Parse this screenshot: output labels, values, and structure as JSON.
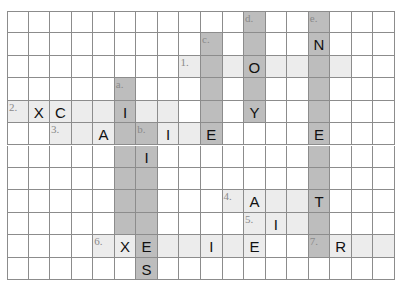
{
  "puzzle": {
    "rows": 12,
    "cols": 18,
    "colors": {
      "grid_line": "#8c8c8c",
      "across_fill": "#ececec",
      "down_fill": "#bdbdbd",
      "letter": "#111111",
      "clue_number": "#8a8a8a"
    },
    "across": [
      {
        "label": "1.",
        "row": 2,
        "col": 8,
        "length": 8
      },
      {
        "label": "2.",
        "row": 4,
        "col": 0,
        "length": 8
      },
      {
        "label": "3.",
        "row": 5,
        "col": 2,
        "length": 8
      },
      {
        "label": "4.",
        "row": 8,
        "col": 10,
        "length": 5
      },
      {
        "label": "5.",
        "row": 9,
        "col": 11,
        "length": 4
      },
      {
        "label": "6.",
        "row": 10,
        "col": 4,
        "length": 8
      },
      {
        "label": "7.",
        "row": 10,
        "col": 14,
        "length": 4
      }
    ],
    "down": [
      {
        "label": "a.",
        "row": 3,
        "col": 5,
        "length": 7
      },
      {
        "label": "b.",
        "row": 5,
        "col": 6,
        "length": 7
      },
      {
        "label": "c.",
        "row": 1,
        "col": 9,
        "length": 5
      },
      {
        "label": "d.",
        "row": 0,
        "col": 11,
        "length": 5
      },
      {
        "label": "e.",
        "row": 0,
        "col": 14,
        "length": 11
      }
    ],
    "letters": [
      {
        "row": 1,
        "col": 14,
        "ch": "N"
      },
      {
        "row": 2,
        "col": 11,
        "ch": "O"
      },
      {
        "row": 4,
        "col": 1,
        "ch": "X"
      },
      {
        "row": 4,
        "col": 2,
        "ch": "C"
      },
      {
        "row": 4,
        "col": 5,
        "ch": "I"
      },
      {
        "row": 4,
        "col": 11,
        "ch": "Y"
      },
      {
        "row": 5,
        "col": 4,
        "ch": "A"
      },
      {
        "row": 5,
        "col": 7,
        "ch": "I"
      },
      {
        "row": 5,
        "col": 9,
        "ch": "E"
      },
      {
        "row": 5,
        "col": 14,
        "ch": "E"
      },
      {
        "row": 6,
        "col": 6,
        "ch": "I"
      },
      {
        "row": 8,
        "col": 11,
        "ch": "A"
      },
      {
        "row": 8,
        "col": 14,
        "ch": "T"
      },
      {
        "row": 9,
        "col": 12,
        "ch": "I"
      },
      {
        "row": 10,
        "col": 5,
        "ch": "X"
      },
      {
        "row": 10,
        "col": 6,
        "ch": "E"
      },
      {
        "row": 10,
        "col": 9,
        "ch": "I"
      },
      {
        "row": 10,
        "col": 11,
        "ch": "E"
      },
      {
        "row": 10,
        "col": 15,
        "ch": "R"
      },
      {
        "row": 11,
        "col": 6,
        "ch": "S"
      }
    ]
  }
}
